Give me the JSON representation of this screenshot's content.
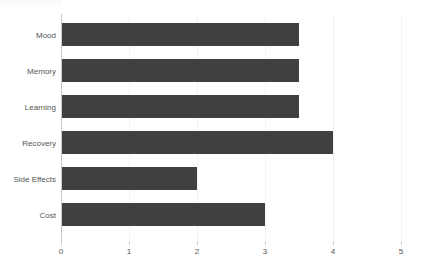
{
  "chart_data": {
    "type": "bar",
    "orientation": "horizontal",
    "title": "",
    "subtitle": "",
    "xlabel": "",
    "ylabel": "",
    "categories": [
      "Mood",
      "Memory",
      "Learning",
      "Recovery",
      "Side Effects",
      "Cost"
    ],
    "values": [
      3.5,
      3.5,
      3.5,
      4,
      2,
      3
    ],
    "series": [
      {
        "name": "",
        "values": [
          3.5,
          3.5,
          3.5,
          4,
          2,
          3
        ]
      }
    ],
    "xlim": [
      0,
      5
    ],
    "xticks": [
      "0",
      "1",
      "2",
      "3",
      "4",
      "5"
    ],
    "xtick_values": [
      0,
      1,
      2,
      3,
      4,
      5
    ],
    "grid": true,
    "grid_axis": "x",
    "legend": false,
    "legend_position": "none",
    "bar_color": "#404040",
    "gridline_color": "#f2f2f2",
    "axis_color": "#c9c9c9",
    "label_color": "#555555",
    "background_color": "#ffffff"
  }
}
